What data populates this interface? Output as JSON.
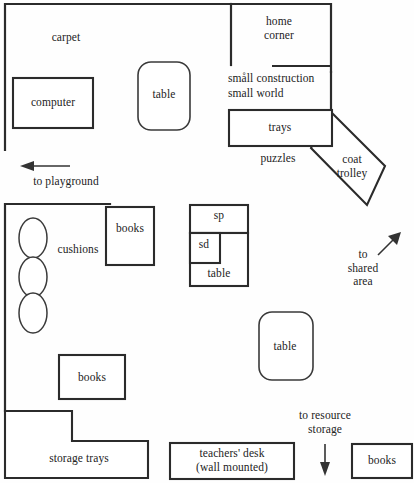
{
  "plan": {
    "title": "classroom floor plan",
    "background_color": "#fefefe",
    "line_color": "#2b2b2b"
  },
  "areas": {
    "carpet": "carpet",
    "home_corner": "home\ncorner",
    "small_construction": "småll construction",
    "small_world": "small world",
    "puzzles": "puzzles",
    "cushions": "cushions"
  },
  "furniture": {
    "computer": "computer",
    "table_top": "table",
    "trays": "trays",
    "coat_trolley": "coat\ntrolley",
    "books_upper": "books",
    "books_lower": "books",
    "books_bottom_right": "books",
    "sp": "sp",
    "sd": "sd",
    "table_sink": "table",
    "table_mid_right": "table",
    "storage_trays": "storage trays",
    "teachers_desk": "teachers' desk\n(wall mounted)"
  },
  "exits": {
    "playground": {
      "label": "to playground",
      "direction": "left"
    },
    "shared_area": {
      "label": "to\nshared\narea",
      "direction": "up-right"
    },
    "resource_storage": {
      "label": "to resource\nstorage",
      "direction": "down"
    }
  }
}
